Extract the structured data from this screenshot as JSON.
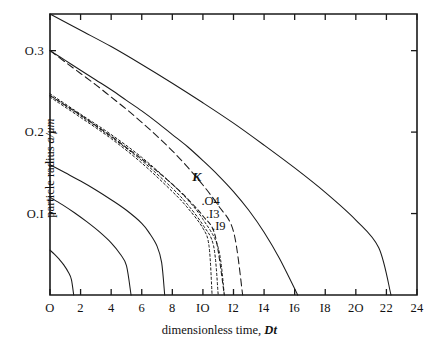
{
  "figure": {
    "background": "#ffffff",
    "ink_color": "#1a1a1a"
  },
  "chart_data": {
    "type": "line",
    "title": "",
    "xlabel_plain": "dimensionless time, ",
    "xlabel_italic": "Dt",
    "ylabel_plain": "particle radius ",
    "ylabel_italic": "a/μm",
    "xlim": [
      0,
      24
    ],
    "ylim": [
      0,
      0.345
    ],
    "xticks": [
      0,
      2,
      4,
      6,
      8,
      10,
      12,
      14,
      16,
      18,
      20,
      22,
      24
    ],
    "xticklabels": [
      "O",
      "2",
      "4",
      "6",
      "8",
      "IO",
      "I2",
      "I4",
      "I6",
      "I8",
      "2O",
      "22",
      "24"
    ],
    "yticks": [
      0.1,
      0.2,
      0.3
    ],
    "yticklabels": [
      "O.I",
      "O.2",
      "O.3"
    ],
    "grid": false,
    "legend_position": "inside-center",
    "ticks_mirrored": true,
    "annotations": [
      {
        "name": "k-legend-title",
        "text": "K",
        "x": 9.3,
        "y": 0.145
      },
      {
        "name": "k-value-04",
        "text": ".O4",
        "x": 9.9,
        "y": 0.114
      },
      {
        "name": "k-value-13",
        "text": ".I3",
        "x": 10.2,
        "y": 0.098
      },
      {
        "name": "k-value-19",
        "text": ".I9",
        "x": 10.6,
        "y": 0.084
      }
    ],
    "series": [
      {
        "name": "solid-outer-22",
        "style": "solid",
        "a0": 0.345,
        "points": [
          [
            0,
            0.345
          ],
          [
            2,
            0.325
          ],
          [
            4,
            0.305
          ],
          [
            6,
            0.283
          ],
          [
            8,
            0.26
          ],
          [
            10,
            0.236
          ],
          [
            12,
            0.211
          ],
          [
            14,
            0.184
          ],
          [
            16,
            0.156
          ],
          [
            18,
            0.126
          ],
          [
            20,
            0.092
          ],
          [
            21.5,
            0.058
          ],
          [
            22.3,
            0.0
          ]
        ]
      },
      {
        "name": "solid-from-0.3",
        "style": "solid",
        "a0": 0.3,
        "points": [
          [
            0,
            0.3
          ],
          [
            1,
            0.288
          ],
          [
            2,
            0.276
          ],
          [
            3,
            0.264
          ],
          [
            4,
            0.252
          ],
          [
            5,
            0.239
          ],
          [
            6,
            0.226
          ],
          [
            7,
            0.212
          ],
          [
            8,
            0.197
          ],
          [
            9,
            0.182
          ],
          [
            10,
            0.165
          ],
          [
            11,
            0.147
          ],
          [
            12,
            0.127
          ],
          [
            13,
            0.104
          ],
          [
            14,
            0.077
          ],
          [
            15,
            0.045
          ],
          [
            16.2,
            0.0
          ]
        ]
      },
      {
        "name": "longdash-from-0.3",
        "style": "longdash",
        "a0": 0.3,
        "points": [
          [
            0,
            0.3
          ],
          [
            1,
            0.286
          ],
          [
            2,
            0.272
          ],
          [
            3,
            0.258
          ],
          [
            4,
            0.243
          ],
          [
            5,
            0.228
          ],
          [
            6,
            0.212
          ],
          [
            7,
            0.195
          ],
          [
            8,
            0.177
          ],
          [
            9,
            0.157
          ],
          [
            10,
            0.135
          ],
          [
            11,
            0.11
          ],
          [
            12,
            0.078
          ],
          [
            12.6,
            0.0
          ]
        ]
      },
      {
        "name": "dashed-from-0.245",
        "style": "dashed",
        "a0": 0.245,
        "points": [
          [
            0,
            0.245
          ],
          [
            1,
            0.233
          ],
          [
            2,
            0.221
          ],
          [
            3,
            0.208
          ],
          [
            4,
            0.195
          ],
          [
            5,
            0.181
          ],
          [
            6,
            0.167
          ],
          [
            7,
            0.152
          ],
          [
            8,
            0.136
          ],
          [
            9,
            0.118
          ],
          [
            10,
            0.097
          ],
          [
            10.8,
            0.073
          ],
          [
            11.4,
            0.0
          ]
        ]
      },
      {
        "name": "dotted-K-0.04",
        "style": "dotted",
        "a0": 0.243,
        "points": [
          [
            0,
            0.243
          ],
          [
            2,
            0.218
          ],
          [
            4,
            0.192
          ],
          [
            6,
            0.162
          ],
          [
            8,
            0.127
          ],
          [
            9,
            0.107
          ],
          [
            10,
            0.082
          ],
          [
            10.4,
            0.06
          ],
          [
            10.6,
            0.0
          ]
        ]
      },
      {
        "name": "dotted-K-0.13",
        "style": "dotted",
        "a0": 0.245,
        "points": [
          [
            0,
            0.245
          ],
          [
            2,
            0.22
          ],
          [
            4,
            0.194
          ],
          [
            6,
            0.165
          ],
          [
            8,
            0.131
          ],
          [
            9,
            0.111
          ],
          [
            10,
            0.086
          ],
          [
            10.7,
            0.06
          ],
          [
            11.0,
            0.0
          ]
        ]
      },
      {
        "name": "dotted-K-0.19",
        "style": "dotted",
        "a0": 0.247,
        "points": [
          [
            0,
            0.247
          ],
          [
            2,
            0.222
          ],
          [
            4,
            0.197
          ],
          [
            6,
            0.169
          ],
          [
            8,
            0.136
          ],
          [
            9,
            0.117
          ],
          [
            10,
            0.093
          ],
          [
            11.0,
            0.058
          ],
          [
            11.4,
            0.0
          ]
        ]
      },
      {
        "name": "solid-from-0.16",
        "style": "solid",
        "a0": 0.16,
        "points": [
          [
            0,
            0.16
          ],
          [
            1,
            0.15
          ],
          [
            2,
            0.14
          ],
          [
            3,
            0.129
          ],
          [
            4,
            0.117
          ],
          [
            5,
            0.104
          ],
          [
            6,
            0.088
          ],
          [
            6.5,
            0.076
          ],
          [
            7,
            0.06
          ],
          [
            7.3,
            0.04
          ],
          [
            7.5,
            0.0
          ]
        ]
      },
      {
        "name": "solid-from-0.12",
        "style": "solid",
        "a0": 0.12,
        "points": [
          [
            0,
            0.12
          ],
          [
            0.8,
            0.111
          ],
          [
            1.6,
            0.101
          ],
          [
            2.4,
            0.09
          ],
          [
            3.2,
            0.078
          ],
          [
            4,
            0.064
          ],
          [
            4.6,
            0.05
          ],
          [
            5,
            0.036
          ],
          [
            5.3,
            0.0
          ]
        ]
      },
      {
        "name": "solid-from-0.055",
        "style": "solid",
        "a0": 0.055,
        "points": [
          [
            0,
            0.055
          ],
          [
            0.3,
            0.05
          ],
          [
            0.6,
            0.044
          ],
          [
            0.9,
            0.037
          ],
          [
            1.2,
            0.028
          ],
          [
            1.4,
            0.019
          ],
          [
            1.55,
            0.0
          ]
        ]
      }
    ]
  }
}
